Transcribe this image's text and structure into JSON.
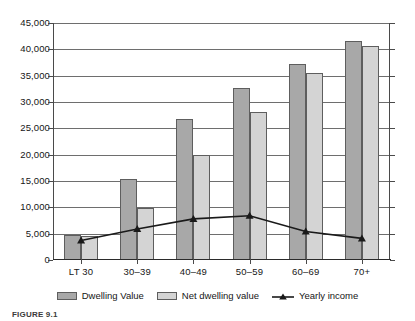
{
  "chart_data": {
    "type": "bar",
    "title": "",
    "xlabel": "",
    "ylabel": "",
    "categories": [
      "LT 30",
      "30–39",
      "40–49",
      "50–59",
      "60–69",
      "70+"
    ],
    "ylim": [
      0,
      45000
    ],
    "ytick_step": 5000,
    "ytick_labels": [
      "0",
      "5,000",
      "10,000",
      "15,000",
      "20,000",
      "25,000",
      "30,000",
      "35,000",
      "40,000",
      "45,000"
    ],
    "ytick_values": [
      0,
      5000,
      10000,
      15000,
      20000,
      25000,
      30000,
      35000,
      40000,
      45000
    ],
    "grid": true,
    "legend_position": "bottom",
    "series": [
      {
        "name": "Dwelling Value",
        "kind": "bar",
        "color": "#a8a8a8",
        "values": [
          4700,
          15400,
          26800,
          32600,
          37300,
          41500
        ]
      },
      {
        "name": "Net dwelling value",
        "kind": "bar",
        "color": "#d4d4d4",
        "values": [
          4500,
          9900,
          20000,
          28100,
          35600,
          40700
        ]
      },
      {
        "name": "Yearly income",
        "kind": "line",
        "color": "#1a1a1a",
        "marker": "triangle",
        "values": [
          3700,
          5900,
          7800,
          8400,
          5400,
          4100
        ]
      }
    ]
  },
  "legend": {
    "items": [
      {
        "label": "Dwelling Value",
        "swatch": "dark-gray-swatch"
      },
      {
        "label": "Net dwelling value",
        "swatch": "light-gray-swatch"
      },
      {
        "label": "Yearly income",
        "swatch": "line-triangle-marker"
      }
    ]
  },
  "caption": {
    "text": "FIGURE 9.1"
  }
}
